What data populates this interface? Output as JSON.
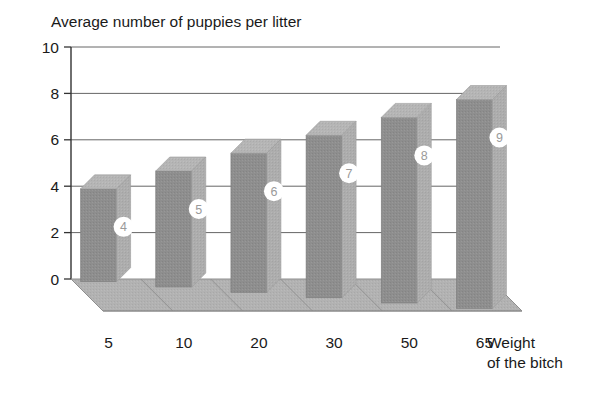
{
  "chart_data": {
    "type": "bar",
    "title": "Average number of puppies per litter",
    "xlabel_line1": "Weight",
    "xlabel_line2": "of the bitch",
    "ylabel": "",
    "categories": [
      "5",
      "10",
      "20",
      "30",
      "50",
      "65"
    ],
    "values": [
      4,
      5,
      6,
      7,
      8,
      9
    ],
    "data_labels": [
      "4",
      "5",
      "6",
      "7",
      "8",
      "9"
    ],
    "ylim": [
      0,
      10
    ],
    "yticks": [
      "0",
      "2",
      "4",
      "6",
      "8",
      "10"
    ],
    "ytick_values": [
      0,
      2,
      4,
      6,
      8,
      10
    ],
    "grid": true,
    "legend": false,
    "style": "3d-bar",
    "colors": {
      "bar_front": "#8e8e8e",
      "bar_top": "#b5b5b5",
      "bar_side": "#aaaaaa",
      "floor": "#b0b0b0",
      "floor_shadow": "#9a9a9a",
      "axis": "#333333",
      "grid": "#555555",
      "text": "#1a1a1a",
      "badge_fill": "#ffffff",
      "badge_text": "#9a9a9a",
      "background": "#ffffff"
    }
  }
}
